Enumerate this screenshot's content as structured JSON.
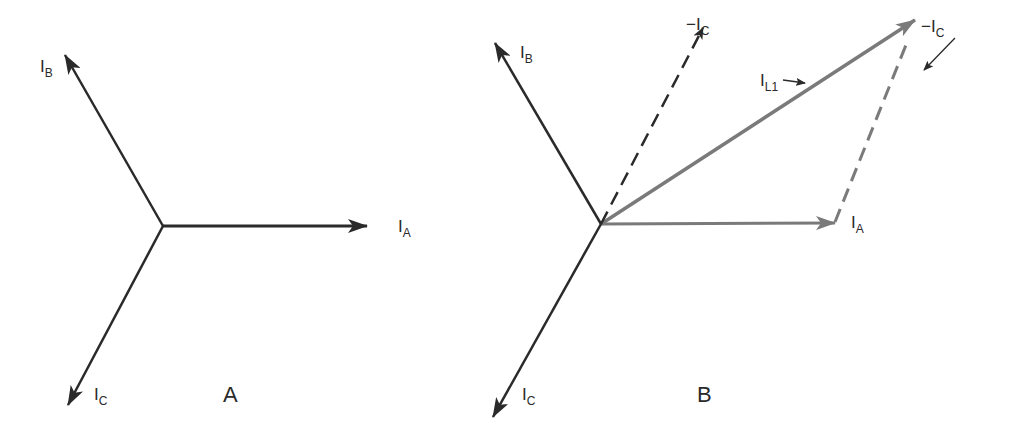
{
  "colors": {
    "primary_vector": "#2a2a2a",
    "resultant_vector": "#7a7a7a",
    "background": "#ffffff"
  },
  "diagram_a": {
    "caption": "A",
    "origin": [
      163,
      226
    ],
    "vectors": [
      {
        "name": "I_A",
        "main": "I",
        "sub": "A",
        "tip": [
          367,
          226
        ],
        "style": "solid"
      },
      {
        "name": "I_B",
        "main": "I",
        "sub": "B",
        "tip": [
          65,
          55
        ],
        "style": "solid"
      },
      {
        "name": "I_C",
        "main": "I",
        "sub": "C",
        "tip": [
          68,
          405
        ],
        "style": "solid"
      }
    ]
  },
  "diagram_b": {
    "caption": "B",
    "origin": [
      601,
      224
    ],
    "vectors": [
      {
        "name": "I_A",
        "main": "I",
        "sub": "A",
        "tip": [
          835,
          222
        ],
        "style": "solid-gray"
      },
      {
        "name": "I_B",
        "main": "I",
        "sub": "B",
        "tip": [
          495,
          43
        ],
        "style": "solid"
      },
      {
        "name": "I_C",
        "main": "I",
        "sub": "C",
        "tip": [
          493,
          417
        ],
        "style": "solid"
      },
      {
        "name": "-I_C",
        "main": "−I",
        "sub": "C",
        "tip": [
          703,
          28
        ],
        "style": "dashed"
      },
      {
        "name": "-I_C (translated)",
        "main": "−I",
        "sub": "C",
        "from": [
          835,
          222
        ],
        "tip": [
          910,
          36
        ],
        "style": "dashed-gray"
      },
      {
        "name": "I_L1",
        "main": "I",
        "sub": "L1",
        "tip": [
          915,
          20
        ],
        "style": "solid-gray-thick"
      }
    ]
  }
}
